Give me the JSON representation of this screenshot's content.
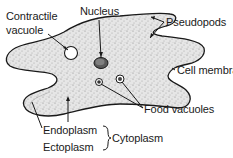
{
  "diagram": {
    "labels": {
      "contractile_vacuole_line1": "Contractile",
      "contractile_vacuole_line2": "vacuole",
      "nucleus": "Nucleus",
      "pseudopods": "Pseudopods",
      "cell_membrane": "Cell membrane",
      "food_vacuoles": "Food vacuoles",
      "endoplasm": "Endoplasm",
      "ectoplasm": "Ectoplasm",
      "cytoplasm": "Cytoplasm"
    },
    "colors": {
      "outline": "#1a1a1a",
      "fill": "#e4e4e4",
      "stipple": "#8a8a8a"
    }
  }
}
